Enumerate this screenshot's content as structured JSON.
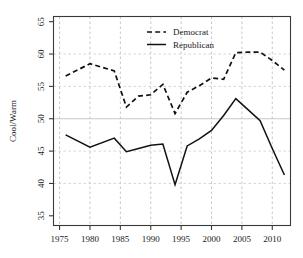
{
  "chart_data": {
    "type": "line",
    "title": "",
    "xlabel": "",
    "ylabel": "Cool/Warm",
    "xlim": [
      1974,
      2013
    ],
    "ylim": [
      33.5,
      65.8
    ],
    "xticks": [
      1975,
      1980,
      1985,
      1990,
      1995,
      2000,
      2005,
      2010
    ],
    "yticks": [
      35,
      40,
      45,
      50,
      55,
      60,
      65
    ],
    "xtick_labels": [
      "1975",
      "1980",
      "1985",
      "1990",
      "1995",
      "2000",
      "2005",
      "2010"
    ],
    "ytick_labels": [
      "35",
      "40",
      "45",
      "50",
      "55",
      "60",
      "65"
    ],
    "grid": "both",
    "legend_position": "top-center",
    "series": [
      {
        "name": "Democrat",
        "style": "dashed",
        "color": "#111111",
        "x": [
          1976,
          1980,
          1984,
          1986,
          1988,
          1990,
          1992,
          1994,
          1996,
          1998,
          2000,
          2002,
          2004,
          2006,
          2008,
          2010,
          2012
        ],
        "values": [
          56.6,
          58.5,
          57.4,
          51.8,
          53.5,
          53.7,
          55.3,
          50.8,
          54.1,
          55.1,
          56.3,
          56.1,
          60.2,
          60.3,
          60.3,
          59.0,
          57.5
        ]
      },
      {
        "name": "Republican",
        "style": "solid",
        "color": "#111111",
        "x": [
          1976,
          1980,
          1984,
          1986,
          1988,
          1990,
          1992,
          1994,
          1996,
          1998,
          2000,
          2002,
          2004,
          2006,
          2008,
          2010,
          2012
        ],
        "values": [
          47.5,
          45.6,
          47.0,
          44.9,
          45.4,
          45.9,
          46.1,
          39.8,
          45.8,
          46.9,
          48.2,
          50.5,
          53.1,
          51.4,
          49.7,
          45.4,
          41.3
        ]
      }
    ]
  },
  "legend": {
    "entries": [
      {
        "label": "Democrat",
        "style": "dashed"
      },
      {
        "label": "Republican",
        "style": "solid"
      }
    ]
  },
  "axes": {
    "y_title": "Cool/Warm"
  }
}
